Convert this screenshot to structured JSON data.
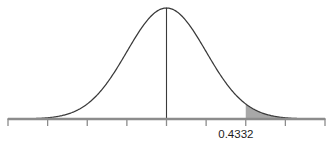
{
  "chart_data": {
    "type": "area",
    "title": "",
    "subtitle": "",
    "xlabel": "",
    "ylabel": "",
    "distribution": "standard-normal",
    "mean": 0,
    "stddev": 1,
    "xlim": [
      -4.0,
      4.0
    ],
    "ylim": [
      0,
      0.4
    ],
    "grid": false,
    "legend": null,
    "x_tick_values": [
      -4,
      -3,
      -2,
      -1,
      0,
      1,
      2,
      3,
      4
    ],
    "x_tick_labels": [
      "",
      "",
      "",
      "",
      "",
      "",
      "",
      "",
      ""
    ],
    "y_tick_values": [],
    "y_tick_labels": [],
    "center_line": {
      "x": 0,
      "visible": true
    },
    "shaded_areas": [
      {
        "name": "right-tail-region",
        "from": 2.0,
        "to": 3.0,
        "fill_color": "#a8a8a8",
        "label": "0.4332",
        "label_x": 1.75
      }
    ],
    "curve_points_x": [
      -4.0,
      -3.8,
      -3.6,
      -3.4,
      -3.2,
      -3.0,
      -2.8,
      -2.6,
      -2.4,
      -2.2,
      -2.0,
      -1.8,
      -1.6,
      -1.4,
      -1.2,
      -1.0,
      -0.8,
      -0.6,
      -0.4,
      -0.2,
      0.0,
      0.2,
      0.4,
      0.6,
      0.8,
      1.0,
      1.2,
      1.4,
      1.6,
      1.8,
      2.0,
      2.2,
      2.4,
      2.6,
      2.8,
      3.0,
      3.2,
      3.4,
      3.6,
      3.8,
      4.0
    ],
    "curve_points_y": [
      0.0001,
      0.0003,
      0.0006,
      0.0012,
      0.0024,
      0.0044,
      0.0079,
      0.0136,
      0.0224,
      0.0355,
      0.054,
      0.079,
      0.1109,
      0.1497,
      0.1942,
      0.242,
      0.2897,
      0.3332,
      0.3683,
      0.391,
      0.3989,
      0.391,
      0.3683,
      0.3332,
      0.2897,
      0.242,
      0.1942,
      0.1497,
      0.1109,
      0.079,
      0.054,
      0.0355,
      0.0224,
      0.0136,
      0.0079,
      0.0044,
      0.0024,
      0.0012,
      0.0006,
      0.0003,
      0.0001
    ]
  },
  "labels": {
    "area_value": "0.4332"
  },
  "colors": {
    "background": "#ffffff",
    "curve_stroke": "#3a3a3a",
    "axis_stroke": "#8c8c8c",
    "shade_fill": "#a8a8a8",
    "text": "#1c1c1c"
  }
}
